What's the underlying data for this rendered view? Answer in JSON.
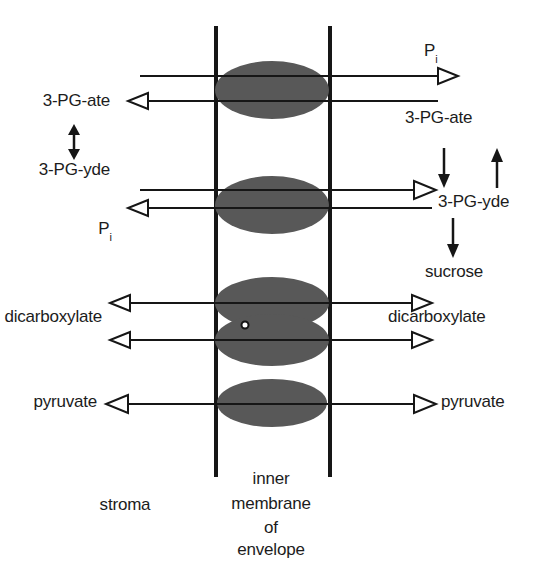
{
  "figure": {
    "background_color": "#ffffff",
    "ink_color": "#161616",
    "pore_fill_color": "#585858"
  },
  "membrane": {
    "label_line1": "inner",
    "label_line2": "membrane",
    "label_line3": "of",
    "label_line4": "envelope"
  },
  "compartments": {
    "left_label": "stroma"
  },
  "left_labels": {
    "pg_ate": "3-PG-ate",
    "pg_yde": "3-PG-yde",
    "pi": "P",
    "pi_sub": "i",
    "dicarboxylate": "dicarboxylate",
    "pyruvate": "pyruvate"
  },
  "right_labels": {
    "pi": "P",
    "pi_sub": "i",
    "pg_ate": "3-PG-ate",
    "pg_yde": "3-PG-yde",
    "sucrose": "sucrose",
    "dicarboxylate": "dicarboxylate",
    "pyruvate": "pyruvate"
  },
  "transporters": [
    {
      "name": "phosphate-translocator-upper",
      "center_y": 90
    },
    {
      "name": "phosphate-translocator-lower",
      "center_y": 205
    },
    {
      "name": "dicarboxylate-translocator-upper",
      "center_y": 303
    },
    {
      "name": "dicarboxylate-translocator-lower",
      "center_y": 340
    },
    {
      "name": "pyruvate-translocator",
      "center_y": 403
    }
  ],
  "caption": {
    "partial_text": ""
  }
}
